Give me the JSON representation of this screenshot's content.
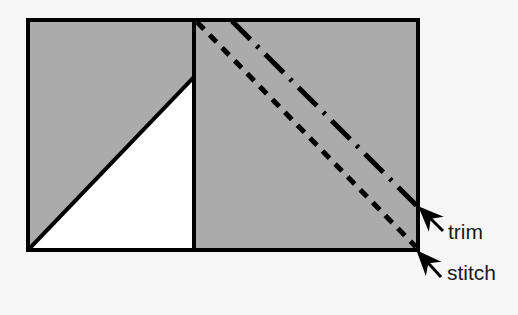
{
  "figure": {
    "background_color": "#f6f6f6",
    "fabric_fill_color": "#ababab",
    "cutaway_fill_color": "#ffffff",
    "outline_color": "#000000",
    "guide_line_color": "#000000"
  },
  "shapes": {
    "fabric_rectangle": {
      "name": "fabric-rectangle",
      "x": 28,
      "y": 20,
      "width": 390,
      "height": 230,
      "stroke_width": 4
    },
    "fold_divider": {
      "name": "vertical-fold-line",
      "x": 194,
      "y_top": 20,
      "y_bottom": 250,
      "stroke_width": 4
    },
    "white_triangle": {
      "name": "white-cutaway-triangle",
      "points": "30,248 192,79 192,248"
    }
  },
  "guides": {
    "trim_line": {
      "label": "trim",
      "style": "dash-dot",
      "x1": 232,
      "y1": 21,
      "x2": 417,
      "y2": 206,
      "stroke_width": 5,
      "dash_pattern": "26 9 3 9"
    },
    "stitch_line": {
      "label": "stitch",
      "style": "short-dash",
      "x1": 197,
      "y1": 22,
      "x2": 416,
      "y2": 247,
      "stroke_width": 5,
      "dash_pattern": "10 8"
    }
  },
  "annotations": [
    {
      "id": "trim-annotation",
      "label": "trim",
      "label_x": 448,
      "label_y": 239,
      "arrow_tail_x": 443,
      "arrow_tail_y": 231,
      "arrow_head_x": 421,
      "arrow_head_y": 209,
      "arrow_stroke_width": 3
    },
    {
      "id": "stitch-annotation",
      "label": "stitch",
      "label_x": 447,
      "label_y": 280,
      "arrow_tail_x": 441,
      "arrow_tail_y": 277,
      "arrow_head_x": 419,
      "arrow_head_y": 253,
      "arrow_stroke_width": 3
    }
  ]
}
